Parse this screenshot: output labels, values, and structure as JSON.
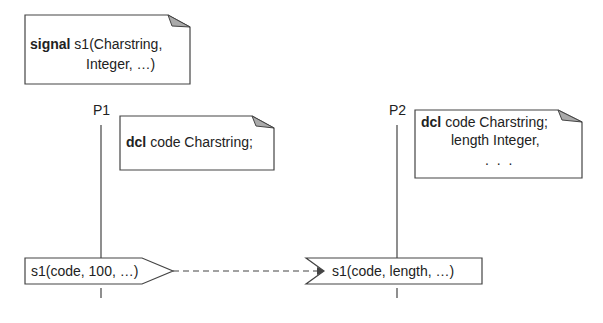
{
  "signal_note": {
    "keyword": "signal",
    "line1_rest": "s1(Charstring,",
    "line2": "Integer, …)"
  },
  "processes": [
    {
      "name": "P1"
    },
    {
      "name": "P2"
    }
  ],
  "p1_note": {
    "keyword": "dcl",
    "rest": "code Charstring;"
  },
  "p2_note": {
    "keyword": "dcl",
    "line1_rest": "code Charstring;",
    "line2": "length Integer,",
    "line3": ". . ."
  },
  "output_signal": {
    "label": "s1(code, 100, …)"
  },
  "input_signal": {
    "label": "s1(code, length, …)"
  },
  "colors": {
    "line": "#444444",
    "fold": "#aaaaaa"
  }
}
